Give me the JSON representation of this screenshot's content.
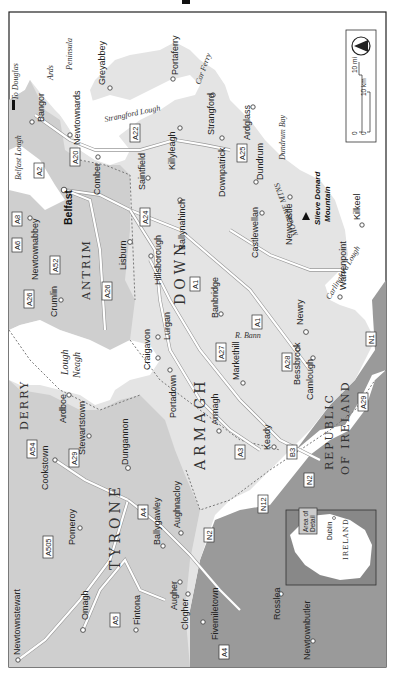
{
  "map": {
    "title": "Northern Ireland",
    "orientation": "rotated 90° clockwise (north points left)",
    "colors": {
      "sea": "#ffffff",
      "ni_land": "#e4e4e4",
      "antrim_tyrone": "#cfcfcf",
      "republic": "#9a9a9a",
      "frame": "#222222"
    },
    "counties": [
      "DOWN",
      "ARMAGH",
      "ANTRIM",
      "TYRONE",
      "DERRY"
    ],
    "country_label": [
      "REPUBLIC",
      "OF IRELAND"
    ],
    "water": {
      "lough_neagh": [
        "Lough",
        "Neagh"
      ],
      "strangford_lough": "Strangford Lough",
      "belfast_lough": "Belfast Lough",
      "carlingford_lough": "Carlingford Lough",
      "dundrum_bay": "Dundrum Bay",
      "ards_peninsula": [
        "Ards",
        "Peninsula"
      ],
      "r_bann": "R. Bann",
      "mourne_mtns": "MOURNE MTNS"
    },
    "ferries": {
      "to_douglas": "To Douglas",
      "car_ferry": "Car Ferry"
    },
    "peak": [
      "Slieve Donard",
      "Mountain"
    ],
    "towns": {
      "belfast": "Belfast",
      "bangor": "Bangor",
      "newtownards": "Newtownards",
      "greyabbey": "Greyabbey",
      "portaferry": "Portaferry",
      "strangford": "Strangford",
      "ardglass": "Ardglass",
      "downpatrick": "Downpatrick",
      "dundrum": "Dundrum",
      "killyleagh": "Killyleagh",
      "saintfield": "Saintfield",
      "comber": "Comber",
      "ballynahinch": "Ballynahinch",
      "castlewellan": "Castlewellan",
      "newcastle": "Newcastle",
      "kilkeel": "Kilkeel",
      "warrenpoint": "Warrenpoint",
      "newry": "Newry",
      "banbridge": "Banbridge",
      "hillsborough": "Hillsborough",
      "lisburn": "Lisburn",
      "newtownabbey": "Newtownabbey",
      "crumlin": "Crumlin",
      "lurgan": "Lurgan",
      "craigavon": "Craigavon",
      "portadown": "Portadown",
      "armagh": "Armagh",
      "markethill": "Markethill",
      "bessbrook": "Bessbrook",
      "camlough": "Camlough",
      "keady": "Keady",
      "ardboe": "Ardboe",
      "stewartstown": "Stewartstown",
      "cookstown": "Cookstown",
      "dungannon": "Dungannon",
      "pomeroy": "Pomeroy",
      "ballygawley": "Ballygawley",
      "aughnacloy": "Aughnacloy",
      "omagh": "Omagh",
      "newtownstewart": "Newtownstewart",
      "fintona": "Fintona",
      "augher": "Augher",
      "clogher": "Clogher",
      "fivemiletown": "Fivemiletown",
      "rosslea": "Rosslea",
      "newtownbutler": "Newtownbutler"
    },
    "roads": [
      "A2",
      "A20",
      "A22",
      "A25",
      "A24",
      "A1",
      "A8",
      "A6",
      "A52",
      "A26",
      "A27",
      "A28",
      "A29",
      "A3",
      "B3",
      "N1",
      "N2",
      "N12",
      "A54",
      "A505",
      "A4",
      "A5"
    ],
    "inset": {
      "label": [
        "Area of",
        "Detail"
      ],
      "dublin": "Dublin",
      "country": "IRELAND"
    },
    "scale": {
      "mi_label": "10 mi",
      "km_label": "10 km",
      "zero": "0"
    },
    "compass": "north-arrow"
  }
}
